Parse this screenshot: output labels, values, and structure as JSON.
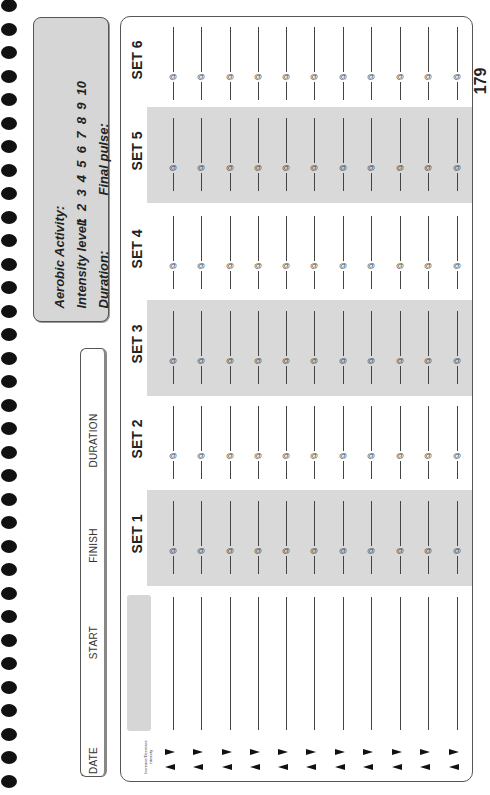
{
  "spiral": {
    "count": 34,
    "spacing": 23.5
  },
  "aerobic": {
    "title": "Aerobic Activity:",
    "intensity_label": "Intensity level:",
    "intensity_levels": "1  2  3  4  5  6  7  8  9  10",
    "duration_label": "Duration:",
    "final_pulse_label": "Final pulse:"
  },
  "log": {
    "date_label": "DATE",
    "start_label": "START",
    "finish_label": "FINISH",
    "duration_label": "DURATION"
  },
  "sets": [
    {
      "label": "SET 1",
      "shaded": true
    },
    {
      "label": "SET 2",
      "shaded": false
    },
    {
      "label": "SET 3",
      "shaded": true
    },
    {
      "label": "SET 4",
      "shaded": false
    },
    {
      "label": "SET 5",
      "shaded": true
    },
    {
      "label": "SET 6",
      "shaded": false
    }
  ],
  "rows": {
    "count": 11,
    "at_symbol": "@"
  },
  "intensity_hint": "Increase/Decrease intensity",
  "page_number": "179",
  "colors": {
    "shade": "#d9d9d9",
    "ink": "#222222",
    "border": "#555555"
  }
}
